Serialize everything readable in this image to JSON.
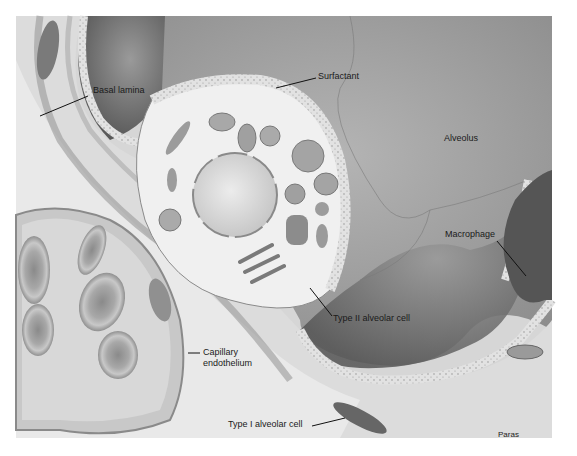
{
  "figure": {
    "style": "grayscale",
    "labels": {
      "basal_lamina": "Basal lamina",
      "surfactant": "Surfactant",
      "alveolus": "Alveolus",
      "macrophage": "Macrophage",
      "type2": "Type II alveolar cell",
      "capillary_1": "Capillary",
      "capillary_2": "endothelium",
      "type1": "Type I alveolar cell"
    },
    "credit": "Paras"
  }
}
